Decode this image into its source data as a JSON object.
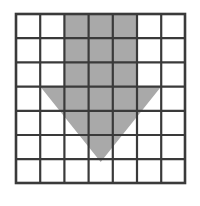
{
  "figure": {
    "type": "grid-shape-diagram",
    "canvas": {
      "width": 200,
      "height": 206,
      "background": "#ffffff"
    },
    "grid": {
      "columns": 7,
      "rows": 7,
      "cell_size": 24.2,
      "origin_x": 16,
      "origin_y": 14,
      "right_x": 185,
      "bottom_y": 183,
      "line_color": "#3a3a3a",
      "line_width": 2.2,
      "border_color": "#3a3a3a",
      "border_width": 2.6,
      "cell_fill": "#ffffff",
      "x_lines": [
        16,
        40.2,
        64.4,
        88.6,
        112.8,
        137,
        161.2,
        185
      ],
      "y_lines": [
        14,
        38.2,
        62.4,
        86.6,
        110.8,
        135,
        159.2,
        183
      ]
    },
    "shape": {
      "name": "downward-arrow",
      "fill": "#a9a9a9",
      "opacity": 1,
      "description": "Rectangular shaft spanning columns 3-5 over rows 1-3, joined to a downward triangle whose top edge spans columns 2-6 at row-4 top and whose apex reaches into row 7.",
      "shaft": {
        "left_x": 64.4,
        "right_x": 137,
        "top_y": 14,
        "bottom_y": 86.6,
        "columns": [
          3,
          4,
          5
        ],
        "rows": [
          1,
          2,
          3
        ]
      },
      "triangle": {
        "left_vertex": {
          "x": 40.2,
          "y": 86.6
        },
        "right_vertex": {
          "x": 161.2,
          "y": 86.6
        },
        "apex": {
          "x": 100.7,
          "y": 162
        }
      },
      "polygon_points": "64.4,14 137,14 137,86.6 161.2,86.6 100.7,162 40.2,86.6 64.4,86.6"
    }
  }
}
